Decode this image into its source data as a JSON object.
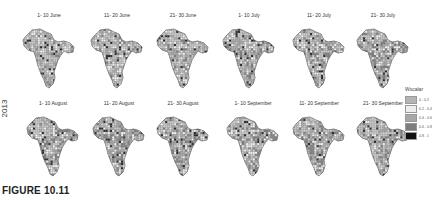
{
  "figure": {
    "caption": "FIGURE 10.11",
    "year_label": "2013"
  },
  "legend": {
    "title": "Wscalar",
    "items": [
      {
        "label": "0 - 0.2",
        "color": "#b5b5b5"
      },
      {
        "label": "0.2 - 0.4",
        "color": "#ededed"
      },
      {
        "label": "0.4 - 0.6",
        "color": "#a8a8a8"
      },
      {
        "label": "0.6 - 0.8",
        "color": "#7e7e7e"
      },
      {
        "label": "0.8 - 1",
        "color": "#111111"
      }
    ]
  },
  "panels": [
    {
      "title": "1- 10 June",
      "shade": "#bdbdbd",
      "density": 0.25
    },
    {
      "title": "11- 20 June",
      "shade": "#b0b0b0",
      "density": 0.3
    },
    {
      "title": "21- 30 June",
      "shade": "#a8a8a8",
      "density": 0.35
    },
    {
      "title": "1- 10 July",
      "shade": "#a0a0a0",
      "density": 0.4
    },
    {
      "title": "11- 20 July",
      "shade": "#959595",
      "density": 0.45
    },
    {
      "title": "21- 30 July",
      "shade": "#8a8a8a",
      "density": 0.55
    },
    {
      "title": "1- 10 August",
      "shade": "#858585",
      "density": 0.55
    },
    {
      "title": "11- 20 August",
      "shade": "#858585",
      "density": 0.55
    },
    {
      "title": "21- 30 August",
      "shade": "#8a8a8a",
      "density": 0.5
    },
    {
      "title": "1- 10 September",
      "shade": "#8f8f8f",
      "density": 0.5
    },
    {
      "title": "11- 20 September",
      "shade": "#9a9a9a",
      "density": 0.4
    },
    {
      "title": "21- 30 September",
      "shade": "#a5a5a5",
      "density": 0.35
    }
  ]
}
